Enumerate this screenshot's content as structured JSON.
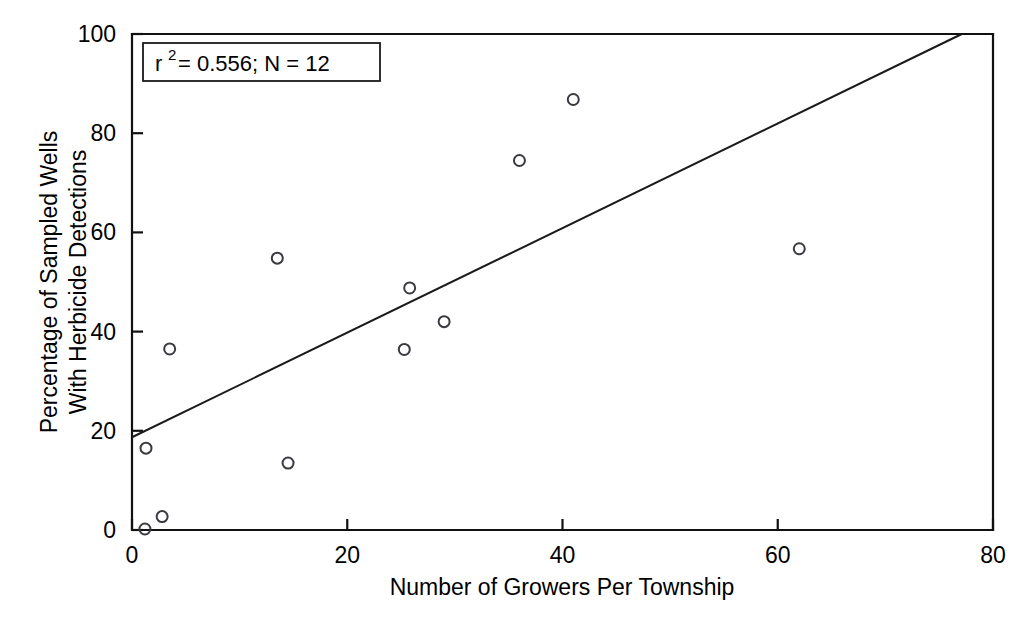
{
  "chart_data": {
    "type": "scatter",
    "title": "",
    "xlabel": "Number of Growers Per Township",
    "ylabel_line1": "Percentage of Sampled Wells",
    "ylabel_line2": "With Herbicide Detections",
    "xlim": [
      0,
      80
    ],
    "ylim": [
      0,
      100
    ],
    "xticks": [
      0,
      20,
      40,
      60,
      80
    ],
    "yticks": [
      0,
      20,
      40,
      60,
      80,
      100
    ],
    "xticklabels": [
      "0",
      "20",
      "40",
      "60",
      "80"
    ],
    "yticklabels": [
      "0",
      "20",
      "40",
      "60",
      "80",
      "100"
    ],
    "grid": false,
    "legend": "none",
    "points": [
      {
        "x": 1.2,
        "y": 0.2
      },
      {
        "x": 1.3,
        "y": 16.5
      },
      {
        "x": 2.8,
        "y": 2.7
      },
      {
        "x": 3.5,
        "y": 36.5
      },
      {
        "x": 13.5,
        "y": 54.8
      },
      {
        "x": 14.5,
        "y": 13.5
      },
      {
        "x": 25.3,
        "y": 36.4
      },
      {
        "x": 25.8,
        "y": 48.8
      },
      {
        "x": 29.0,
        "y": 42.0
      },
      {
        "x": 36.0,
        "y": 74.5
      },
      {
        "x": 41.0,
        "y": 86.8
      },
      {
        "x": 62.0,
        "y": 56.7
      }
    ],
    "marker": {
      "shape": "open-circle",
      "size": 11,
      "color": "#3a3a40"
    },
    "trendline": {
      "type": "linear-fit",
      "x_start": 0.0,
      "y_start": 18.7,
      "x_end": 77.1,
      "y_end": 100.0,
      "color": "#1a1a1a"
    },
    "annotation": {
      "r_squared_label": "r",
      "r_squared_exponent": "2",
      "text": " = 0.556; N = 12",
      "full_text": "r2 = 0.556; N = 12",
      "boxed": true
    }
  }
}
